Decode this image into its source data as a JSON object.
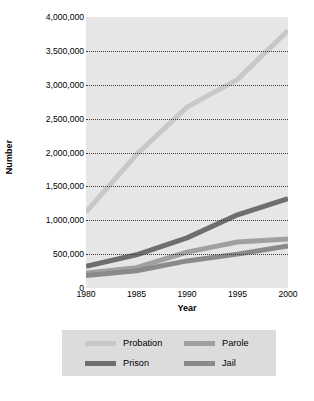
{
  "chart_data": {
    "type": "line",
    "title": "",
    "xlabel": "Year",
    "ylabel": "Number",
    "x": [
      1980,
      1985,
      1990,
      1995,
      2000
    ],
    "xticklabels": [
      "1980",
      "1985",
      "1990",
      "1995",
      "2000"
    ],
    "xlim": [
      1980,
      2000
    ],
    "ylim": [
      0,
      4000000
    ],
    "yticks": [
      0,
      500000,
      1000000,
      1500000,
      2000000,
      2500000,
      3000000,
      3500000,
      4000000
    ],
    "yticklabels": [
      "0",
      "500,000",
      "1,000,000",
      "1,500,000",
      "2,000,000",
      "2,500,000",
      "3,000,000",
      "3,500,000",
      "4,000,000"
    ],
    "grid": "horizontal-dotted",
    "legend_position": "below-plot",
    "series": [
      {
        "name": "Probation",
        "color": "#c8c8c8",
        "values": [
          1120000,
          1970000,
          2670000,
          3080000,
          3800000
        ]
      },
      {
        "name": "Parole",
        "color": "#a0a0a0",
        "values": [
          220000,
          300000,
          530000,
          680000,
          725000
        ]
      },
      {
        "name": "Prison",
        "color": "#6e6e6e",
        "values": [
          320000,
          490000,
          740000,
          1080000,
          1320000
        ]
      },
      {
        "name": "Jail",
        "color": "#8a8a8a",
        "values": [
          185000,
          255000,
          400000,
          500000,
          620000
        ]
      }
    ]
  },
  "legend": {
    "rows": [
      [
        {
          "label": "Probation",
          "color": "#c8c8c8"
        },
        {
          "label": "Parole",
          "color": "#a0a0a0"
        }
      ],
      [
        {
          "label": "Prison",
          "color": "#6e6e6e"
        },
        {
          "label": "Jail",
          "color": "#8a8a8a"
        }
      ]
    ]
  }
}
